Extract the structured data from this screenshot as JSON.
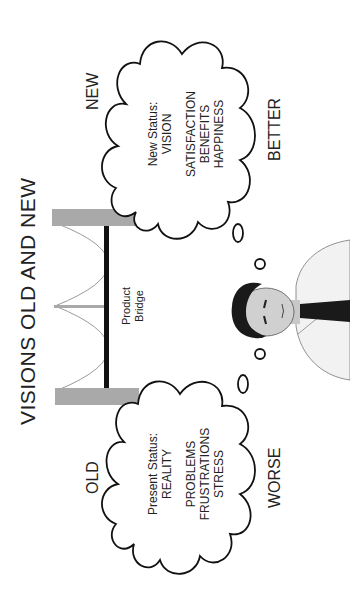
{
  "title": "VISIONS OLD AND NEW",
  "old": {
    "heading": "OLD",
    "status_label": "Present Status:",
    "status_value": "REALITY",
    "items": [
      "PROBLEMS",
      "FRUSTRATIONS",
      "STRESS"
    ],
    "outcome": "WORSE"
  },
  "new": {
    "heading": "NEW",
    "status_label": "New Status:",
    "status_value": "VISION",
    "items": [
      "SATISFACTION",
      "BENEFITS",
      "HAPPINESS"
    ],
    "outcome": "BETTER"
  },
  "bridge": {
    "line1": "Product",
    "line2": "Bridge"
  },
  "colors": {
    "pillar": "#a9a9a9",
    "deck": "#111111",
    "cable": "#999999",
    "outline": "#111111"
  }
}
